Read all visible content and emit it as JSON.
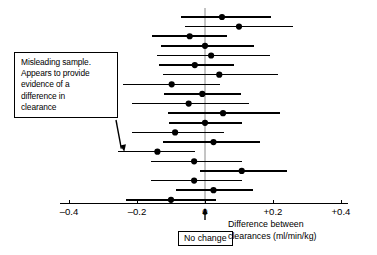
{
  "chart_data": {
    "type": "scatter",
    "plot_style": "forest-plot-confidence-intervals",
    "title": "",
    "xlabel": "Difference between clearances (ml/min/kg)",
    "ylabel": "",
    "xlim": [
      -0.4,
      0.4
    ],
    "xticks": [
      -0.4,
      -0.2,
      0,
      0.2,
      0.4
    ],
    "xtick_labels": [
      "–0.4",
      "–0.2",
      "0",
      "+0.2",
      "+0.4"
    ],
    "grid": false,
    "legend": null,
    "reference_line": {
      "value": 0,
      "label": "No change"
    },
    "series": [
      {
        "name": "Sample confidence intervals",
        "point_color": "#000000",
        "line_color": "#000000",
        "points": [
          {
            "index": 1,
            "estimate": 0.05,
            "ci_low": -0.07,
            "ci_high": 0.195,
            "crosses_zero": true
          },
          {
            "index": 2,
            "estimate": 0.1,
            "ci_low": -0.06,
            "ci_high": 0.26,
            "crosses_zero": true
          },
          {
            "index": 3,
            "estimate": -0.045,
            "ci_low": -0.155,
            "ci_high": 0.065,
            "crosses_zero": true
          },
          {
            "index": 4,
            "estimate": 0.0,
            "ci_low": -0.13,
            "ci_high": 0.145,
            "crosses_zero": true
          },
          {
            "index": 5,
            "estimate": 0.018,
            "ci_low": -0.14,
            "ci_high": 0.19,
            "crosses_zero": true
          },
          {
            "index": 6,
            "estimate": -0.03,
            "ci_low": -0.135,
            "ci_high": 0.085,
            "crosses_zero": true
          },
          {
            "index": 7,
            "estimate": 0.042,
            "ci_low": -0.125,
            "ci_high": 0.215,
            "crosses_zero": true
          },
          {
            "index": 8,
            "estimate": -0.098,
            "ci_low": -0.24,
            "ci_high": 0.045,
            "crosses_zero": true
          },
          {
            "index": 9,
            "estimate": -0.008,
            "ci_low": -0.12,
            "ci_high": 0.105,
            "crosses_zero": true
          },
          {
            "index": 10,
            "estimate": -0.048,
            "ci_low": -0.215,
            "ci_high": 0.13,
            "crosses_zero": true
          },
          {
            "index": 11,
            "estimate": 0.053,
            "ci_low": -0.11,
            "ci_high": 0.22,
            "crosses_zero": true
          },
          {
            "index": 12,
            "estimate": 0.0,
            "ci_low": -0.105,
            "ci_high": 0.108,
            "crosses_zero": true
          },
          {
            "index": 13,
            "estimate": -0.088,
            "ci_low": -0.215,
            "ci_high": 0.055,
            "crosses_zero": true
          },
          {
            "index": 14,
            "estimate": 0.025,
            "ci_low": -0.125,
            "ci_high": 0.162,
            "crosses_zero": true
          },
          {
            "index": 15,
            "estimate": -0.14,
            "ci_low": -0.255,
            "ci_high": -0.03,
            "crosses_zero": false,
            "note": "misleading sample"
          },
          {
            "index": 16,
            "estimate": -0.032,
            "ci_low": -0.16,
            "ci_high": 0.108,
            "crosses_zero": true
          },
          {
            "index": 17,
            "estimate": 0.108,
            "ci_low": -0.015,
            "ci_high": 0.242,
            "crosses_zero": true
          },
          {
            "index": 18,
            "estimate": -0.032,
            "ci_low": -0.158,
            "ci_high": 0.108,
            "crosses_zero": true
          },
          {
            "index": 19,
            "estimate": 0.025,
            "ci_low": -0.085,
            "ci_high": 0.14,
            "crosses_zero": true
          },
          {
            "index": 20,
            "estimate": -0.1,
            "ci_low": -0.232,
            "ci_high": 0.032,
            "crosses_zero": true
          }
        ]
      }
    ],
    "annotations": [
      {
        "name": "misleading-sample-callout",
        "lines": [
          "Misleading sample.",
          "Appears to provide",
          "evidence of a",
          "difference in",
          "clearance"
        ],
        "points_to_index": 15
      },
      {
        "name": "no-change-marker",
        "text": "No change",
        "at_value": 0
      }
    ]
  },
  "axis": {
    "ticks": [
      {
        "label": "–0.4",
        "value": -0.4
      },
      {
        "label": "–0.2",
        "value": -0.2
      },
      {
        "label": "0",
        "value": 0
      },
      {
        "label": "+0.2",
        "value": 0.2
      },
      {
        "label": "+0.4",
        "value": 0.4
      }
    ],
    "caption_line1": "Difference between",
    "caption_line2": "clearances (ml/min/kg)"
  },
  "callout": {
    "line1": "Misleading sample.",
    "line2": "Appears to provide",
    "line3": "evidence of a",
    "line4": "difference in",
    "line5": "clearance"
  },
  "no_change": {
    "label": "No change"
  },
  "colors": {
    "ink": "#000000",
    "background": "#ffffff",
    "zero_line": "#8a8a8a"
  }
}
